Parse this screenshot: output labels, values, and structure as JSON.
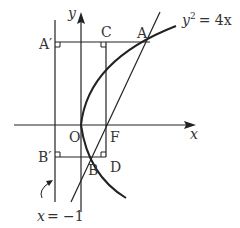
{
  "diagram": {
    "type": "parabola-focal-chord",
    "equation_label": "y² = 4x",
    "equation_parts": {
      "y": "y",
      "exp": "2",
      "rhs": "= 4x"
    },
    "directrix_label": "x = −1",
    "directrix_parts": {
      "x": "x",
      "rhs": "= −1"
    },
    "axes": {
      "x_label": "x",
      "y_label": "y"
    },
    "points": {
      "A": "A",
      "A_prime": "A′",
      "B": "B",
      "B_prime": "B′",
      "C": "C",
      "D": "D",
      "F": "F",
      "O": "O"
    },
    "colors": {
      "line": "#222222",
      "text": "#333333",
      "background": "#ffffff"
    }
  }
}
